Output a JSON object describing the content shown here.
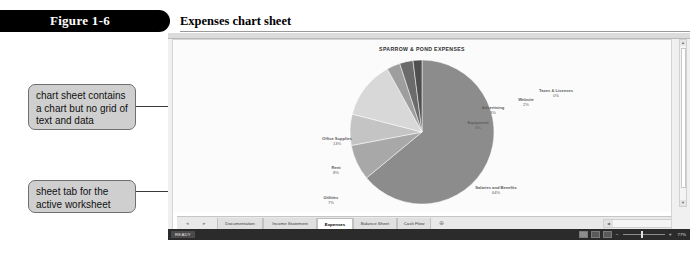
{
  "figure": {
    "number": "Figure 1-6",
    "caption": "Expenses chart sheet"
  },
  "callouts": [
    {
      "id": "chart-sheet",
      "text": "chart sheet contains a chart but no grid of text and data"
    },
    {
      "id": "sheet-tab",
      "text": "sheet tab for the active worksheet"
    }
  ],
  "chart_data": {
    "type": "pie",
    "title": "SPARROW & POND EXPENSES",
    "xlabel": "",
    "ylabel": "",
    "legend": "none",
    "labels_show_percent": true,
    "categories": [
      "Salaries and Benefits",
      "Rent",
      "Utilities",
      "Office Supplies",
      "Equipment",
      "Advertising",
      "Website",
      "Taxes & Licenses"
    ],
    "values": [
      64,
      8,
      7,
      13,
      3,
      3,
      2,
      0
    ],
    "labels": [
      {
        "name": "Salaries and Benefits",
        "percent": "64%"
      },
      {
        "name": "Rent",
        "percent": "8%"
      },
      {
        "name": "Utilities",
        "percent": "7%"
      },
      {
        "name": "Office Supplies",
        "percent": "13%"
      },
      {
        "name": "Equipment",
        "percent": "3%"
      },
      {
        "name": "Advertising",
        "percent": "3%"
      },
      {
        "name": "Website",
        "percent": "2%"
      },
      {
        "name": "Taxes & Licenses",
        "percent": "0%"
      }
    ],
    "colors": [
      "#8c8c8c",
      "#a8a8a8",
      "#c4c4c4",
      "#d8d8d8",
      "#9e9e9e",
      "#6b6b6b",
      "#4f4f4f",
      "#3a3a3a"
    ]
  },
  "workbook": {
    "tabs": [
      {
        "label": "Documentation",
        "active": false
      },
      {
        "label": "Income Statement",
        "active": false
      },
      {
        "label": "Expenses",
        "active": true
      },
      {
        "label": "Balance Sheet",
        "active": false
      },
      {
        "label": "Cash Flow",
        "active": false
      }
    ],
    "add_sheet_icon": "plus-circle-icon",
    "nav_prev": "◂",
    "nav_next": "▸"
  },
  "statusbar": {
    "mode": "READY",
    "views": [
      "normal-view",
      "page-layout-view",
      "page-break-view"
    ],
    "zoom_minus": "−",
    "zoom_plus": "+",
    "zoom_level": "77%"
  }
}
